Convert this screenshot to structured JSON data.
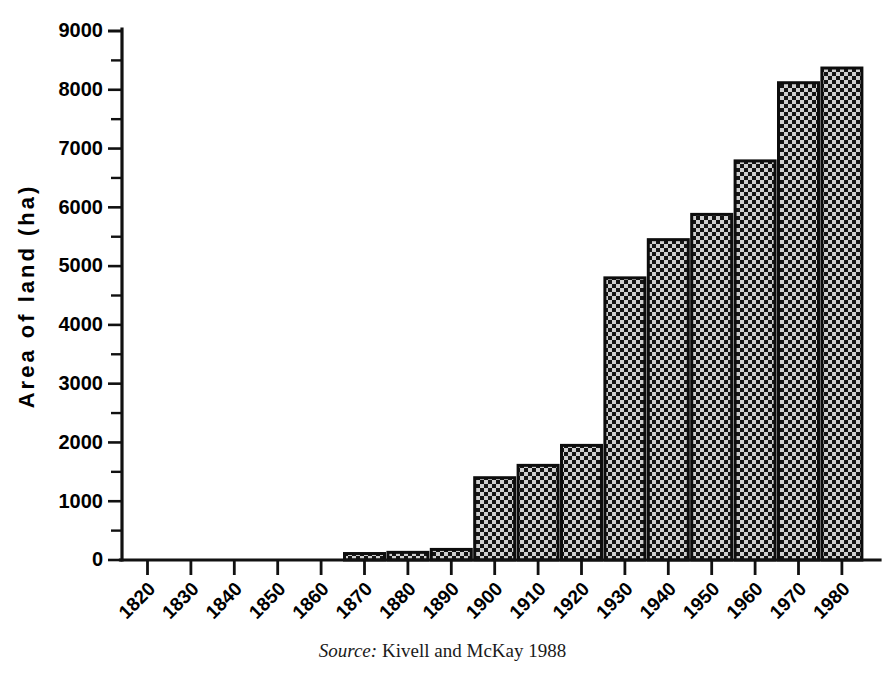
{
  "figure": {
    "source_label": "Source:",
    "source_text": "Kivell and McKay 1988"
  },
  "chart_data": {
    "type": "bar",
    "title": "",
    "xlabel": "",
    "ylabel": "Area of land (ha)",
    "ylim": [
      0,
      9000
    ],
    "ytick_step": 1000,
    "yminor_step": 500,
    "grid": false,
    "legend": false,
    "bar_fill": "checkerboard",
    "bar_edge_color": "#0d0d0d",
    "categories": [
      "1820",
      "1830",
      "1840",
      "1850",
      "1860",
      "1870",
      "1880",
      "1890",
      "1900",
      "1910",
      "1920",
      "1930",
      "1940",
      "1950",
      "1960",
      "1970",
      "1980"
    ],
    "values": [
      0,
      0,
      0,
      0,
      0,
      110,
      130,
      180,
      1400,
      1610,
      1950,
      4800,
      5450,
      5880,
      6790,
      8120,
      8370
    ],
    "ytick_labels": [
      "0",
      "1000",
      "2000",
      "3000",
      "4000",
      "5000",
      "6000",
      "7000",
      "8000",
      "9000"
    ],
    "ytick_values": [
      0,
      1000,
      2000,
      3000,
      4000,
      5000,
      6000,
      7000,
      8000,
      9000
    ]
  }
}
